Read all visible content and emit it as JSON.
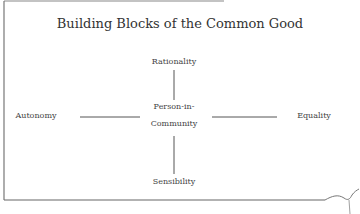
{
  "diagram": {
    "title": "Building Blocks of the Common Good",
    "center": {
      "line1": "Person-in-",
      "line2": "Community"
    },
    "top": "Rationality",
    "bottom": "Sensibility",
    "left": "Autonomy",
    "right": "Equality"
  }
}
